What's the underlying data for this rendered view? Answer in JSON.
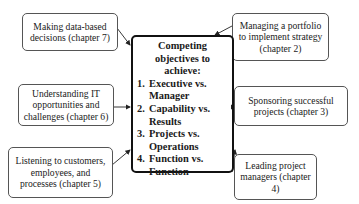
{
  "diagram": {
    "center": {
      "title": "Competing objectives to achieve:",
      "items": [
        {
          "num": "1.",
          "text": "Executive vs. Manager"
        },
        {
          "num": "2.",
          "text": "Capability vs. Results"
        },
        {
          "num": "3.",
          "text": "Projects vs. Operations"
        },
        {
          "num": "4.",
          "text": "Function vs. Function"
        }
      ]
    },
    "nodes": [
      {
        "id": "data-decisions",
        "label": "Making data-based decisions (chapter 7)"
      },
      {
        "id": "portfolio",
        "label": "Managing a portfolio to implement strategy (chapter 2)"
      },
      {
        "id": "it-opportunities",
        "label": "Understanding IT opportunities and challenges (chapter 6)"
      },
      {
        "id": "sponsoring",
        "label": "Sponsoring successful projects (chapter 3)"
      },
      {
        "id": "listening",
        "label": "Listening to customers, employees, and processes (chapter 5)"
      },
      {
        "id": "leading",
        "label": "Leading project managers (chapter 4)"
      }
    ],
    "colors": {
      "border": "#555555",
      "center_border": "#111111",
      "arrow": "#222222"
    }
  }
}
